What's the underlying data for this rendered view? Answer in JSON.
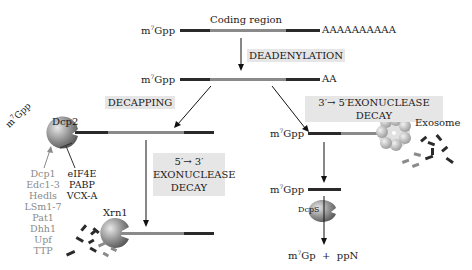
{
  "mrna_top": {
    "cap": "m7Gpp",
    "coding_label": "Coding region",
    "tail": "AAAAAAAAAA"
  },
  "deadenylation": {
    "label": "DEADENYLATION",
    "cap": "m7Gpp",
    "tail": "AA"
  },
  "decapping": {
    "label": "DECAPPING",
    "enzyme": "Dcp2",
    "cap_released": "m7Gpp",
    "activators": [
      "Dcp1",
      "Edc1-3",
      "Hedls",
      "LSm1-7",
      "Pat1",
      "Dhh1",
      "Upf",
      "TTP"
    ],
    "inhibitors": [
      "eIF4E",
      "PABP",
      "VCX-A"
    ]
  },
  "decay_5_3": {
    "label_line1": "5′→ 3′",
    "label_line2": "EXONUCLEASE",
    "label_line3": "DECAY",
    "enzyme": "Xrn1"
  },
  "decay_3_5": {
    "label": "3′→ 5′EXONUCLEASE DECAY",
    "cap": "m7Gpp",
    "complex": "Exosome",
    "cap_after": "m7Gpp",
    "scavenger": "DcpS",
    "products": "m7Gp  +  ppN"
  },
  "colors": {
    "utr": "#2a2a2a",
    "coding": "#8a8a8a",
    "box_bg": "#e6e6e6",
    "enzyme": "#8c8c8c"
  }
}
